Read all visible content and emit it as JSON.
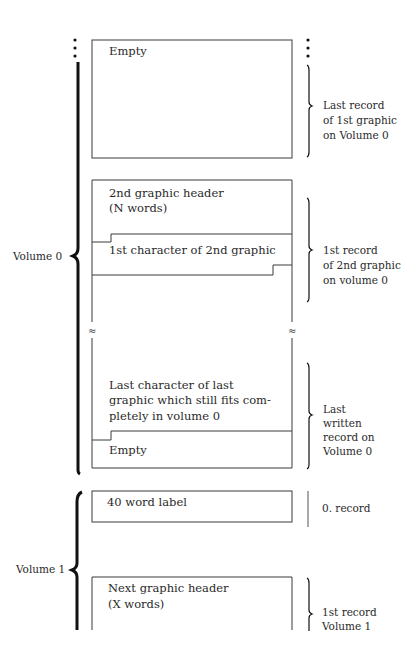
{
  "diagram": {
    "boxes": [
      {
        "id": "empty-top",
        "lines": [
          "Empty"
        ]
      },
      {
        "id": "second-graphic-header",
        "lines": [
          "2nd graphic header",
          "(N words)"
        ]
      },
      {
        "id": "first-char-second-graphic",
        "lines": [
          "1st character of 2nd graphic"
        ]
      },
      {
        "id": "last-char-last-graphic",
        "lines": [
          "Last character of last",
          "graphic which still fits com-",
          "pletely in volume 0"
        ]
      },
      {
        "id": "empty-bottom",
        "lines": [
          "Empty"
        ]
      },
      {
        "id": "label-40-word",
        "lines": [
          "40 word label"
        ]
      },
      {
        "id": "next-graphic-header",
        "lines": [
          "Next graphic header",
          "(X words)"
        ]
      }
    ],
    "right_annotations": [
      {
        "lines": [
          "Last record",
          "of 1st graphic",
          "on Volume 0"
        ]
      },
      {
        "lines": [
          "1st record",
          "of 2nd graphic",
          "on volume 0"
        ]
      },
      {
        "lines": [
          "Last",
          "written",
          "record on",
          "Volume 0"
        ]
      },
      {
        "lines": [
          "0. record"
        ]
      },
      {
        "lines": [
          "1st record",
          "Volume 1"
        ]
      }
    ],
    "volumes": [
      {
        "label": "Volume 0"
      },
      {
        "label": "Volume 1"
      }
    ],
    "break_symbol": "≈",
    "colors": {
      "line": "#3a3a3a",
      "brace": "#111111",
      "text": "#2a2a2a"
    }
  }
}
